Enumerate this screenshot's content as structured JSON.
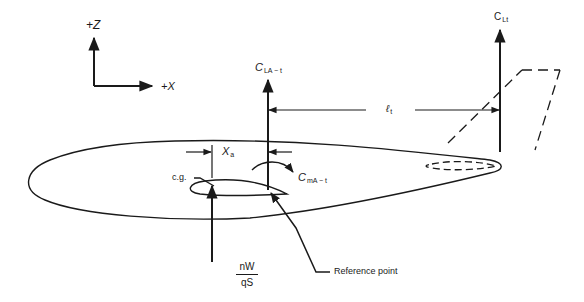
{
  "diagram": {
    "type": "aircraft longitudinal force & moment diagram",
    "axes": {
      "z_label": "+Z",
      "x_label": "+X"
    },
    "labels": {
      "wing_lift": {
        "main": "C",
        "sub": "LA − t"
      },
      "wing_moment": {
        "main": "C",
        "sub": "mA − t"
      },
      "tail_lift": {
        "main": "C",
        "sub": "Lt"
      },
      "tail_arm": {
        "main": "ℓ",
        "sub": "t"
      },
      "cg_offset": {
        "main": "X",
        "sub": "a"
      },
      "cg": "c.g.",
      "reference_point": "Reference point",
      "load_numerator": "nW",
      "load_denominator": "qS"
    },
    "colors": {
      "line": "#1a1a1a",
      "background": "#ffffff"
    }
  }
}
